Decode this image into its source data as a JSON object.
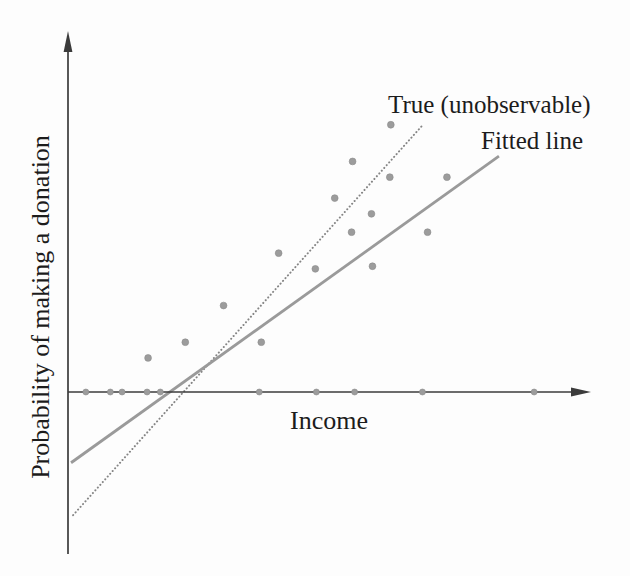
{
  "figure": {
    "background": "#fdfdfd",
    "text_color": "#1c1c1c"
  },
  "chart_data": {
    "type": "scatter",
    "title": "",
    "xlabel": "Income",
    "ylabel": "Probability of making a donation",
    "x_range": [
      0,
      10.3
    ],
    "y_range": [
      -0.62,
      1.37
    ],
    "grid": false,
    "ticks": "none",
    "legend_position": "inline-annotations-top-right",
    "axis_color": "#3b3b3b",
    "point_color": "#9c9c9c",
    "points": [
      {
        "x": 1.57,
        "y": 0.13
      },
      {
        "x": 2.3,
        "y": 0.19
      },
      {
        "x": 3.05,
        "y": 0.33
      },
      {
        "x": 3.79,
        "y": 0.19
      },
      {
        "x": 4.13,
        "y": 0.53
      },
      {
        "x": 4.85,
        "y": 0.47
      },
      {
        "x": 5.23,
        "y": 0.74
      },
      {
        "x": 5.56,
        "y": 0.61
      },
      {
        "x": 5.58,
        "y": 0.88
      },
      {
        "x": 5.95,
        "y": 0.68
      },
      {
        "x": 5.97,
        "y": 0.48
      },
      {
        "x": 6.31,
        "y": 0.82
      },
      {
        "x": 6.33,
        "y": 1.02
      },
      {
        "x": 7.05,
        "y": 0.61
      },
      {
        "x": 7.43,
        "y": 0.82
      }
    ],
    "points_on_x_axis": [
      0.35,
      0.83,
      1.06,
      1.55,
      1.81,
      3.75,
      4.87,
      5.62,
      6.95,
      9.14
    ],
    "lines": [
      {
        "label": "True (unobservable)",
        "style": "dotted",
        "color": "#858585",
        "x1": 0.1,
        "y1": -0.47,
        "x2": 6.96,
        "y2": 1.02
      },
      {
        "label": "Fitted line",
        "style": "solid",
        "color": "#9a9a9a",
        "x1": 0.06,
        "y1": -0.27,
        "x2": 8.45,
        "y2": 0.9
      }
    ]
  }
}
